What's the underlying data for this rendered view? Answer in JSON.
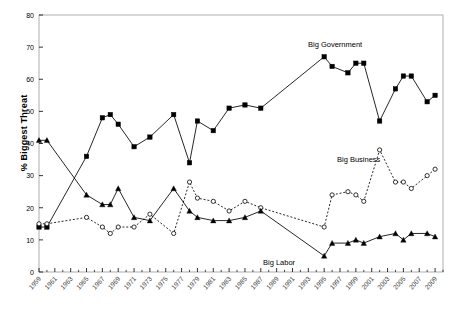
{
  "axes": {
    "ylabel": "% Biggest Threat",
    "yticks": [
      0,
      10,
      20,
      30,
      40,
      50,
      60,
      70,
      80
    ],
    "ylim": [
      0,
      80
    ],
    "xticklabels": [
      "1959",
      "1961",
      "1963",
      "1965",
      "1967",
      "1969",
      "1971",
      "1973",
      "1975",
      "1977",
      "1979",
      "1981",
      "1983",
      "1985",
      "1987",
      "1989",
      "1991",
      "1993",
      "1995",
      "1997",
      "1999",
      "2001",
      "2003",
      "2005",
      "2007",
      "2009"
    ],
    "xlim": [
      1959,
      2010
    ]
  },
  "annotations": {
    "big_government": "Big Government",
    "big_business": "Big Business",
    "big_labor": "Big Labor"
  },
  "chart_data": {
    "type": "line",
    "title": "",
    "xlabel": "",
    "ylabel": "% Biggest Threat",
    "ylim": [
      0,
      80
    ],
    "xlim": [
      1959,
      2010
    ],
    "grid": false,
    "legend": "inline-annotations",
    "series": [
      {
        "name": "Big Government",
        "marker": "filled-square",
        "linestyle": "solid",
        "color": "#000000",
        "points": [
          {
            "x": 1959,
            "y": 14
          },
          {
            "x": 1960,
            "y": 14
          },
          {
            "x": 1965,
            "y": 36
          },
          {
            "x": 1967,
            "y": 48
          },
          {
            "x": 1968,
            "y": 49
          },
          {
            "x": 1969,
            "y": 46
          },
          {
            "x": 1971,
            "y": 39
          },
          {
            "x": 1973,
            "y": 42
          },
          {
            "x": 1976,
            "y": 49
          },
          {
            "x": 1978,
            "y": 34
          },
          {
            "x": 1979,
            "y": 47
          },
          {
            "x": 1981,
            "y": 44
          },
          {
            "x": 1983,
            "y": 51
          },
          {
            "x": 1985,
            "y": 52
          },
          {
            "x": 1987,
            "y": 51
          },
          {
            "x": 1995,
            "y": 67
          },
          {
            "x": 1996,
            "y": 64
          },
          {
            "x": 1998,
            "y": 62
          },
          {
            "x": 1999,
            "y": 65
          },
          {
            "x": 2000,
            "y": 65
          },
          {
            "x": 2002,
            "y": 47
          },
          {
            "x": 2004,
            "y": 57
          },
          {
            "x": 2005,
            "y": 61
          },
          {
            "x": 2006,
            "y": 61
          },
          {
            "x": 2008,
            "y": 53
          },
          {
            "x": 2009,
            "y": 55
          }
        ]
      },
      {
        "name": "Big Business",
        "marker": "open-circle",
        "linestyle": "dotted",
        "color": "#000000",
        "points": [
          {
            "x": 1959,
            "y": 15
          },
          {
            "x": 1960,
            "y": 15
          },
          {
            "x": 1965,
            "y": 17
          },
          {
            "x": 1967,
            "y": 14
          },
          {
            "x": 1968,
            "y": 12
          },
          {
            "x": 1969,
            "y": 14
          },
          {
            "x": 1971,
            "y": 14
          },
          {
            "x": 1973,
            "y": 18
          },
          {
            "x": 1976,
            "y": 12
          },
          {
            "x": 1978,
            "y": 28
          },
          {
            "x": 1979,
            "y": 23
          },
          {
            "x": 1981,
            "y": 22
          },
          {
            "x": 1983,
            "y": 19
          },
          {
            "x": 1985,
            "y": 22
          },
          {
            "x": 1987,
            "y": 20
          },
          {
            "x": 1995,
            "y": 14
          },
          {
            "x": 1996,
            "y": 24
          },
          {
            "x": 1998,
            "y": 25
          },
          {
            "x": 1999,
            "y": 24
          },
          {
            "x": 2000,
            "y": 22
          },
          {
            "x": 2002,
            "y": 38
          },
          {
            "x": 2004,
            "y": 28
          },
          {
            "x": 2005,
            "y": 28
          },
          {
            "x": 2006,
            "y": 26
          },
          {
            "x": 2008,
            "y": 30
          },
          {
            "x": 2009,
            "y": 32
          }
        ]
      },
      {
        "name": "Big Labor",
        "marker": "filled-triangle",
        "linestyle": "solid",
        "color": "#000000",
        "points": [
          {
            "x": 1959,
            "y": 41
          },
          {
            "x": 1960,
            "y": 41
          },
          {
            "x": 1965,
            "y": 24
          },
          {
            "x": 1967,
            "y": 21
          },
          {
            "x": 1968,
            "y": 21
          },
          {
            "x": 1969,
            "y": 26
          },
          {
            "x": 1971,
            "y": 17
          },
          {
            "x": 1973,
            "y": 16
          },
          {
            "x": 1976,
            "y": 26
          },
          {
            "x": 1978,
            "y": 19
          },
          {
            "x": 1979,
            "y": 17
          },
          {
            "x": 1981,
            "y": 16
          },
          {
            "x": 1983,
            "y": 16
          },
          {
            "x": 1985,
            "y": 17
          },
          {
            "x": 1987,
            "y": 19
          },
          {
            "x": 1995,
            "y": 5
          },
          {
            "x": 1996,
            "y": 9
          },
          {
            "x": 1998,
            "y": 9
          },
          {
            "x": 1999,
            "y": 10
          },
          {
            "x": 2000,
            "y": 9
          },
          {
            "x": 2002,
            "y": 11
          },
          {
            "x": 2004,
            "y": 12
          },
          {
            "x": 2005,
            "y": 10
          },
          {
            "x": 2006,
            "y": 12
          },
          {
            "x": 2008,
            "y": 12
          },
          {
            "x": 2009,
            "y": 11
          }
        ]
      }
    ]
  }
}
